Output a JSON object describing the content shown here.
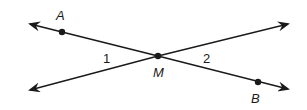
{
  "diagram": {
    "type": "intersecting-lines",
    "points": {
      "A": {
        "label": "A",
        "x": 62,
        "y": 32
      },
      "M": {
        "label": "M",
        "x": 158,
        "y": 56
      },
      "B": {
        "label": "B",
        "x": 258,
        "y": 82
      }
    },
    "angles": [
      {
        "label": "1"
      },
      {
        "label": "2"
      }
    ],
    "colors": {
      "line": "#1a1a1a",
      "background": "#ffffff"
    }
  }
}
